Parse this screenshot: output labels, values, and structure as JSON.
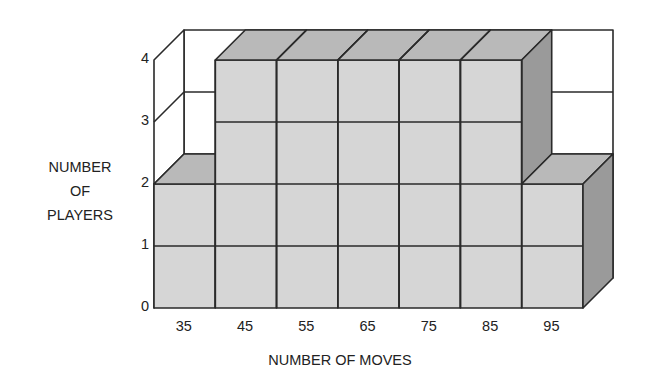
{
  "chart_data": {
    "type": "bar",
    "style": "3d-stacked-unit-cubes",
    "title": "",
    "xlabel": "NUMBER OF MOVES",
    "ylabel": "NUMBER OF PLAYERS",
    "ylabel_lines": [
      "NUMBER",
      "OF",
      "PLAYERS"
    ],
    "categories": [
      "35",
      "45",
      "55",
      "65",
      "75",
      "85",
      "95"
    ],
    "values": [
      2,
      4,
      4,
      4,
      4,
      4,
      2
    ],
    "y_ticks": [
      "0",
      "1",
      "2",
      "3",
      "4"
    ],
    "ylim": [
      0,
      4
    ],
    "grid": true,
    "legend": null,
    "colors": {
      "front": "#d6d6d6",
      "top": "#b9b9b9",
      "side": "#9a9a9a",
      "wall": "#ffffff",
      "line": "#2a2a2a"
    }
  }
}
